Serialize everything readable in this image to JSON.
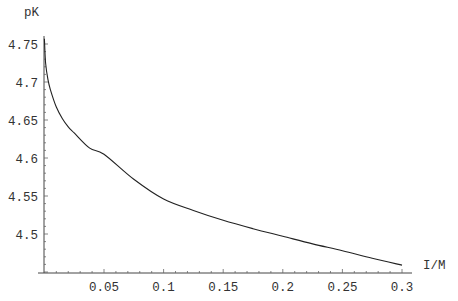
{
  "chart_data": {
    "type": "line",
    "title": "",
    "xlabel": "I/M",
    "ylabel": "pK",
    "xlim": [
      0,
      0.305
    ],
    "ylim": [
      4.449,
      4.762
    ],
    "grid": false,
    "legend": null,
    "x_ticks": [
      0.05,
      0.1,
      0.15,
      0.2,
      0.25,
      0.3
    ],
    "x_tick_labels": [
      "0.05",
      "0.1",
      "0.15",
      "0.2",
      "0.25",
      "0.3"
    ],
    "y_ticks": [
      4.5,
      4.55,
      4.6,
      4.65,
      4.7,
      4.75
    ],
    "y_tick_labels": [
      "4.5",
      "4.55",
      "4.6",
      "4.65",
      "4.7",
      "4.75"
    ],
    "series": [
      {
        "name": "pK",
        "color": "#222222",
        "x": [
          0.0,
          0.001,
          0.003,
          0.005,
          0.01,
          0.015,
          0.02,
          0.025,
          0.038,
          0.05,
          0.075,
          0.1,
          0.125,
          0.15,
          0.175,
          0.2,
          0.225,
          0.25,
          0.275,
          0.3
        ],
        "y": [
          4.757,
          4.725,
          4.703,
          4.69,
          4.667,
          4.652,
          4.641,
          4.633,
          4.613,
          4.605,
          4.572,
          4.546,
          4.531,
          4.518,
          4.507,
          4.497,
          4.487,
          4.478,
          4.468,
          4.459
        ]
      }
    ]
  }
}
